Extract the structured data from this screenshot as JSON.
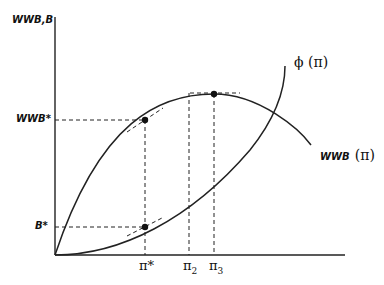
{
  "axes": {
    "y_label": "WWB,B",
    "x_ticks": {
      "pi_star": "π*",
      "pi2": "π",
      "pi2_sub": "2",
      "pi3": "π",
      "pi3_sub": "3"
    },
    "y_ticks": {
      "wwb_star": "WWB*",
      "b_star": "B*"
    }
  },
  "curves": {
    "phi": "ϕ (π)",
    "wwb_name": "WWB",
    "wwb_arg": "(π)"
  }
}
